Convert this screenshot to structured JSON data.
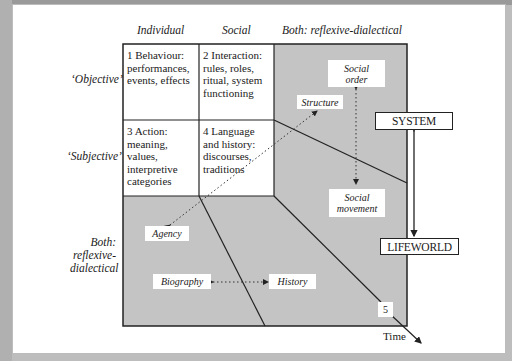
{
  "columns": {
    "individual": "Individual",
    "social": "Social",
    "both": "Both: reflexive-dialectical"
  },
  "rows": {
    "objective": "‘Objective’",
    "subjective": "‘Subjective’",
    "both_line1": "Both:",
    "both_line2": "reflexive-",
    "both_line3": "dialectical"
  },
  "cells": [
    {
      "id": 1,
      "lines": [
        "1 Behaviour:",
        "performances,",
        "events, effects"
      ]
    },
    {
      "id": 2,
      "lines": [
        "2 Interaction:",
        "rules, roles,",
        "ritual, system",
        "functioning"
      ]
    },
    {
      "id": 3,
      "lines": [
        "3 Action:",
        "meaning,",
        "values,",
        "interpretive",
        "categories"
      ]
    },
    {
      "id": 4,
      "lines": [
        "4 Language",
        "and history:",
        "discourses,",
        "traditions"
      ]
    }
  ],
  "tags": {
    "social_order_1": "Social",
    "social_order_2": "order",
    "structure": "Structure",
    "social_movement_1": "Social",
    "social_movement_2": "movement",
    "agency": "Agency",
    "biography": "Biography",
    "history": "History",
    "five": "5"
  },
  "boxes": {
    "system": "SYSTEM",
    "lifeworld": "LIFEWORLD"
  },
  "axis": {
    "time": "Time"
  },
  "colors": {
    "shaded": "#c4c4c4",
    "line": "#222222",
    "frame": "#bcbcbc"
  }
}
